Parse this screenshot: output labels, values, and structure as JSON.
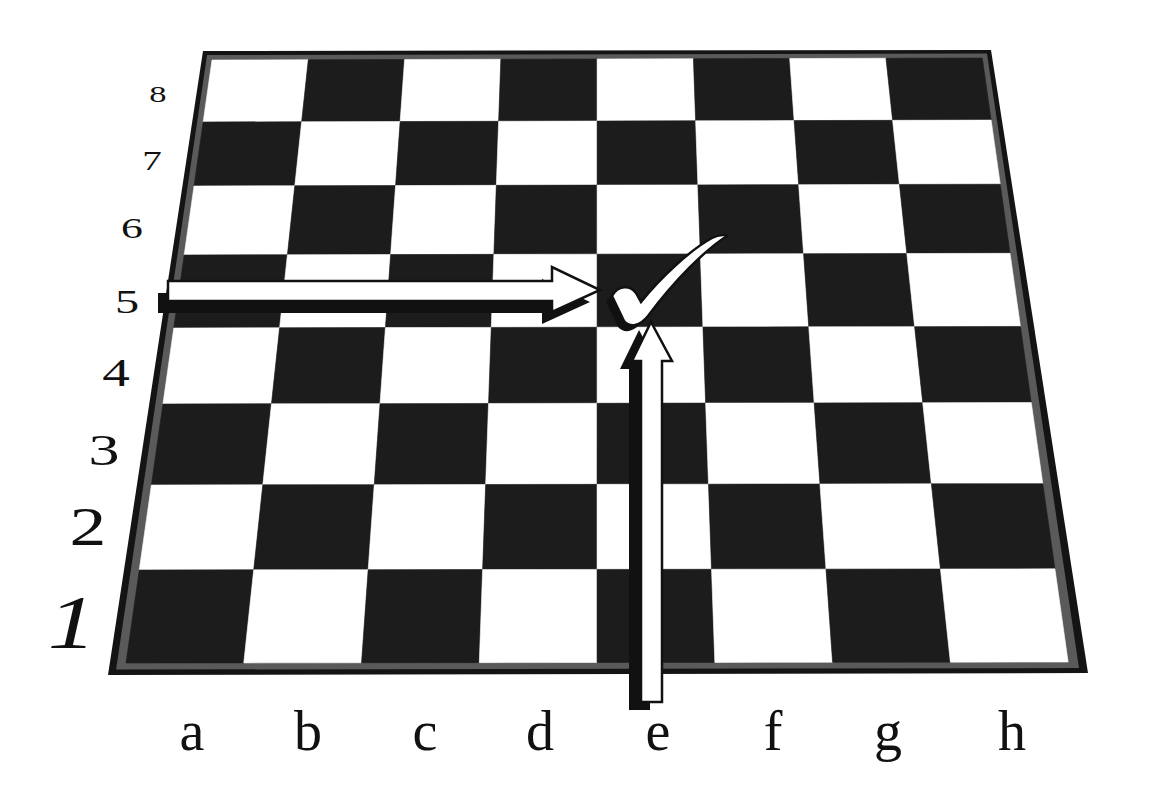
{
  "figure": {
    "highlighted_square": "e5"
  },
  "board": {
    "colors": {
      "light": "#ffffff",
      "dark": "#1c1c1c",
      "frame_outer": "#141414",
      "frame_inner": "#5a5a5a",
      "arrow_fill": "#ffffff",
      "arrow_stroke": "#111111",
      "shadow": "#111111"
    },
    "outer_corners": {
      "tl": [
        203,
        51
      ],
      "tr": [
        991,
        50
      ],
      "br": [
        1088,
        673
      ],
      "bl": [
        108,
        675
      ]
    },
    "inner_corners": {
      "tl": [
        212,
        60
      ],
      "tr": [
        982,
        58
      ],
      "br": [
        1068,
        662
      ],
      "bl": [
        126,
        663
      ]
    },
    "row_edges_left_y": [
      60,
      122,
      186,
      255,
      328,
      404,
      485,
      570,
      663
    ],
    "files": [
      "a",
      "b",
      "c",
      "d",
      "e",
      "f",
      "g",
      "h"
    ],
    "ranks": [
      "8",
      "7",
      "6",
      "5",
      "4",
      "3",
      "2",
      "1"
    ]
  },
  "file_labels": [
    {
      "text": "a",
      "x": 192
    },
    {
      "text": "b",
      "x": 308
    },
    {
      "text": "c",
      "x": 425
    },
    {
      "text": "d",
      "x": 540
    },
    {
      "text": "e",
      "x": 658
    },
    {
      "text": "f",
      "x": 773
    },
    {
      "text": "g",
      "x": 888
    },
    {
      "text": "h",
      "x": 1012
    }
  ],
  "file_label_baseline": 750,
  "file_label_size": 56,
  "rank_labels": [
    {
      "text": "8",
      "x": 158,
      "y": 102,
      "size": 30,
      "sy": 0.75
    },
    {
      "text": "7",
      "x": 152,
      "y": 170,
      "size": 34,
      "sy": 0.78
    },
    {
      "text": "6",
      "x": 132,
      "y": 238,
      "size": 38,
      "sy": 0.75
    },
    {
      "text": "5",
      "x": 127,
      "y": 313,
      "size": 42,
      "sy": 0.8
    },
    {
      "text": "4",
      "x": 116,
      "y": 386,
      "size": 48,
      "sy": 0.82
    },
    {
      "text": "3",
      "x": 104,
      "y": 465,
      "size": 54,
      "sy": 0.82
    },
    {
      "text": "2",
      "x": 88,
      "y": 545,
      "size": 64,
      "sy": 0.85
    },
    {
      "text": "1",
      "x": 72,
      "y": 648,
      "size": 84,
      "sy": 0.9
    }
  ],
  "arrows": {
    "horizontal": {
      "label": "rank-5 arrow pointing to e5",
      "body": [
        [
          168,
          281
        ],
        [
          552,
          281
        ],
        [
          552,
          267
        ],
        [
          600,
          290
        ],
        [
          552,
          312
        ],
        [
          552,
          301
        ],
        [
          168,
          301
        ]
      ],
      "shadow_offset": [
        -10,
        12
      ]
    },
    "vertical": {
      "label": "e-file arrow pointing to e5",
      "body": [
        [
          641,
          702
        ],
        [
          641,
          361
        ],
        [
          632,
          361
        ],
        [
          651,
          322
        ],
        [
          672,
          361
        ],
        [
          662,
          361
        ],
        [
          662,
          702
        ]
      ],
      "shadow_offset": [
        -12,
        8
      ]
    }
  },
  "checkmark": {
    "label": "check mark on e5",
    "path": "M 612 296 C 618 285, 630 285, 636 293 L 641 302 C 660 278, 690 250, 712 238 C 720 234, 727 235, 727 236 C 705 250, 675 280, 648 316 C 640 326, 630 328, 624 321 Z",
    "shadow_path": "M 606 302 C 612 291, 624 291, 630 299 L 635 308 L 642 322 C 634 332, 624 334, 618 327 Z"
  }
}
